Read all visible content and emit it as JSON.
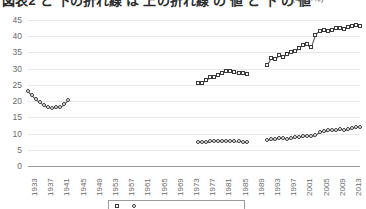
{
  "title": {
    "main": "図表2 と 下の折れ線 は 上の折れ線 の 値 と 下 の 値",
    "unit": "(単位:％)",
    "clipped": true
  },
  "axes": {
    "y": {
      "label": "",
      "ticks": [
        0,
        5,
        10,
        15,
        20,
        25,
        30,
        35,
        40,
        45
      ],
      "min": 0,
      "max": 45,
      "grid": true
    },
    "x": {
      "label": "",
      "ticks": [
        "1933",
        "1937",
        "1941",
        "1945",
        "1949",
        "1953",
        "1957",
        "1961",
        "1965",
        "1969",
        "1973",
        "1977",
        "1981",
        "1985",
        "1989",
        "1993",
        "1997",
        "2001",
        "2005",
        "2009",
        "2013"
      ],
      "min": 1933,
      "max": 2015,
      "tick_step": 4
    }
  },
  "legend": {
    "position": "bottom",
    "bordered": true,
    "clipped": true,
    "entries": [
      {
        "name": "series-upper",
        "marker": "square",
        "label": ""
      },
      {
        "name": "series-lower",
        "marker": "circle",
        "label": ""
      }
    ]
  },
  "colors": {
    "marker_edge": "#3a3a3a",
    "marker_fill": "#ffffff",
    "line": "#4a4a4a",
    "grid": "#e8e8e8",
    "axis": "#9a9a9a",
    "tick_text": "#6b6b6b"
  },
  "chart_data": {
    "type": "line",
    "title": "図表2 と 下の折れ線 は 上の折れ線 の 値 と 下 の 値",
    "subtitle": "(単位:％)",
    "xlabel": "",
    "ylabel": "",
    "ylim": [
      0,
      45
    ],
    "xlim": [
      1933,
      2015
    ],
    "grid": true,
    "legend_position": "bottom",
    "marker_style": "open",
    "series": [
      {
        "name": "series-upper",
        "marker": "circle",
        "points": [
          {
            "x": 1933,
            "y": 23.0
          },
          {
            "x": 1934,
            "y": 21.8
          },
          {
            "x": 1935,
            "y": 20.6
          },
          {
            "x": 1936,
            "y": 19.6
          },
          {
            "x": 1937,
            "y": 18.7
          },
          {
            "x": 1938,
            "y": 18.2
          },
          {
            "x": 1939,
            "y": 18.0
          },
          {
            "x": 1940,
            "y": 18.3
          },
          {
            "x": 1941,
            "y": 18.2
          },
          {
            "x": 1942,
            "y": 19.0
          },
          {
            "x": 1943,
            "y": 20.2
          }
        ]
      },
      {
        "name": "series-upper-mid",
        "marker": "square",
        "points": [
          {
            "x": 1975,
            "y": 25.6
          },
          {
            "x": 1976,
            "y": 25.5
          },
          {
            "x": 1977,
            "y": 26.6
          },
          {
            "x": 1978,
            "y": 27.4
          },
          {
            "x": 1979,
            "y": 27.4
          },
          {
            "x": 1980,
            "y": 28.2
          },
          {
            "x": 1981,
            "y": 28.8
          },
          {
            "x": 1982,
            "y": 29.3
          },
          {
            "x": 1983,
            "y": 29.4
          },
          {
            "x": 1984,
            "y": 29.0
          },
          {
            "x": 1985,
            "y": 28.8
          },
          {
            "x": 1986,
            "y": 28.6
          },
          {
            "x": 1987,
            "y": 28.4
          }
        ]
      },
      {
        "name": "series-upper-late",
        "marker": "square",
        "points": [
          {
            "x": 1992,
            "y": 31.0
          },
          {
            "x": 1993,
            "y": 33.3
          },
          {
            "x": 1994,
            "y": 33.1
          },
          {
            "x": 1995,
            "y": 34.2
          },
          {
            "x": 1996,
            "y": 33.6
          },
          {
            "x": 1997,
            "y": 34.6
          },
          {
            "x": 1998,
            "y": 35.2
          },
          {
            "x": 1999,
            "y": 35.4
          },
          {
            "x": 2000,
            "y": 36.3
          },
          {
            "x": 2001,
            "y": 37.4
          },
          {
            "x": 2002,
            "y": 37.6
          },
          {
            "x": 2003,
            "y": 36.6
          },
          {
            "x": 2004,
            "y": 40.3
          },
          {
            "x": 2005,
            "y": 41.7
          },
          {
            "x": 2006,
            "y": 41.9
          },
          {
            "x": 2007,
            "y": 41.5
          },
          {
            "x": 2008,
            "y": 41.9
          },
          {
            "x": 2009,
            "y": 42.6
          },
          {
            "x": 2010,
            "y": 42.6
          },
          {
            "x": 2011,
            "y": 42.1
          },
          {
            "x": 2012,
            "y": 42.7
          },
          {
            "x": 2013,
            "y": 43.2
          },
          {
            "x": 2014,
            "y": 43.4
          },
          {
            "x": 2015,
            "y": 43.3
          }
        ]
      },
      {
        "name": "series-lower-mid",
        "marker": "circle",
        "points": [
          {
            "x": 1975,
            "y": 7.4
          },
          {
            "x": 1976,
            "y": 7.4
          },
          {
            "x": 1977,
            "y": 7.5
          },
          {
            "x": 1978,
            "y": 7.6
          },
          {
            "x": 1979,
            "y": 7.6
          },
          {
            "x": 1980,
            "y": 7.7
          },
          {
            "x": 1981,
            "y": 7.6
          },
          {
            "x": 1982,
            "y": 7.7
          },
          {
            "x": 1983,
            "y": 7.8
          },
          {
            "x": 1984,
            "y": 7.8
          },
          {
            "x": 1985,
            "y": 7.6
          },
          {
            "x": 1986,
            "y": 7.5
          },
          {
            "x": 1987,
            "y": 7.4
          }
        ]
      },
      {
        "name": "series-lower-late",
        "marker": "circle",
        "points": [
          {
            "x": 1992,
            "y": 8.1
          },
          {
            "x": 1993,
            "y": 8.4
          },
          {
            "x": 1994,
            "y": 8.2
          },
          {
            "x": 1995,
            "y": 8.6
          },
          {
            "x": 1996,
            "y": 8.5
          },
          {
            "x": 1997,
            "y": 8.3
          },
          {
            "x": 1998,
            "y": 8.6
          },
          {
            "x": 1999,
            "y": 8.8
          },
          {
            "x": 2000,
            "y": 9.0
          },
          {
            "x": 2001,
            "y": 9.2
          },
          {
            "x": 2002,
            "y": 9.3
          },
          {
            "x": 2003,
            "y": 9.4
          },
          {
            "x": 2004,
            "y": 9.6
          },
          {
            "x": 2005,
            "y": 10.4
          },
          {
            "x": 2006,
            "y": 10.9
          },
          {
            "x": 2007,
            "y": 11.0
          },
          {
            "x": 2008,
            "y": 11.2
          },
          {
            "x": 2009,
            "y": 11.1
          },
          {
            "x": 2010,
            "y": 11.3
          },
          {
            "x": 2011,
            "y": 11.2
          },
          {
            "x": 2012,
            "y": 11.4
          },
          {
            "x": 2013,
            "y": 11.6
          },
          {
            "x": 2014,
            "y": 11.9
          },
          {
            "x": 2015,
            "y": 12.0
          }
        ]
      }
    ]
  }
}
